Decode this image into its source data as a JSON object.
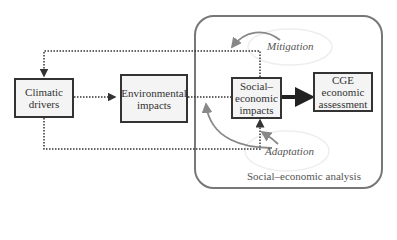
{
  "diagram": {
    "nodes": {
      "climatic": {
        "line1": "Climatic",
        "line2": "drivers"
      },
      "environmental": {
        "line1": "Environmental",
        "line2": "impacts"
      },
      "social": {
        "line1": "Social–",
        "line2": "economic",
        "line3": "impacts"
      },
      "cge": {
        "line1": "CGE",
        "line2": "economic",
        "line3": "assessment"
      }
    },
    "ellipses": {
      "mitigation": "Mitigation",
      "adaptation": "Adaptation"
    },
    "container_label": "Social–economic analysis",
    "edges": [
      {
        "from": "climatic",
        "to": "environmental",
        "style": "dotted"
      },
      {
        "from": "environmental",
        "to": "social",
        "style": "dotted"
      },
      {
        "from": "social",
        "to": "cge",
        "style": "solid-thick"
      },
      {
        "from": "social",
        "to": "climatic",
        "style": "dotted",
        "route": "top"
      },
      {
        "from": "climatic",
        "to": "social",
        "style": "dotted",
        "route": "bottom"
      },
      {
        "from": "mitigation",
        "to": "top-feedback",
        "style": "curved-gray"
      },
      {
        "from": "adaptation",
        "to": "social",
        "style": "curved-gray"
      },
      {
        "from": "adaptation",
        "to": "environmental-social-link",
        "style": "curved-gray"
      }
    ]
  }
}
